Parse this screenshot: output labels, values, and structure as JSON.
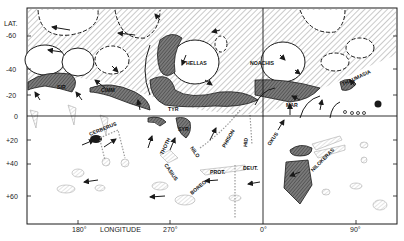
{
  "map": {
    "subject": "Mars",
    "y_axis": {
      "title": "LAT.",
      "ticks": [
        "-60",
        "-40",
        "-20",
        "0",
        "+20",
        "+40",
        "+60"
      ]
    },
    "x_axis": {
      "title": "LONGITUDE",
      "ticks": [
        "180°",
        "270°",
        "0°",
        "90°"
      ]
    },
    "regions": [
      {
        "name": "SIR",
        "label": "SIR"
      },
      {
        "name": "CIMM",
        "label": "CIMM"
      },
      {
        "name": "HELLAS",
        "label": "HELLAS"
      },
      {
        "name": "NOACHIS",
        "label": "NOACHIS"
      },
      {
        "name": "THAUMASIA",
        "label": "THAUMASIA"
      },
      {
        "name": "TYR",
        "label": "TYR"
      },
      {
        "name": "MAR",
        "label": "MAR"
      },
      {
        "name": "CERBERUS",
        "label": "CERBERUS"
      },
      {
        "name": "SYR",
        "label": "SYR"
      },
      {
        "name": "THOTH",
        "label": "THOTH"
      },
      {
        "name": "NILO",
        "label": "NILO"
      },
      {
        "name": "PHISON",
        "label": "PHISON"
      },
      {
        "name": "HID",
        "label": "HID"
      },
      {
        "name": "OXUS",
        "label": "OXUS"
      },
      {
        "name": "CASIUS",
        "label": "CASIUS"
      },
      {
        "name": "PROT",
        "label": "PROT."
      },
      {
        "name": "DEUT",
        "label": "DEUT."
      },
      {
        "name": "BOREO",
        "label": "BOREO."
      },
      {
        "name": "NILOKERAS",
        "label": "NILOKERAS"
      }
    ],
    "colors": {
      "ink": "#1a1a1a",
      "dark_fill": "#555555",
      "hatch": "#8a8a8a",
      "paper": "#ffffff"
    }
  }
}
